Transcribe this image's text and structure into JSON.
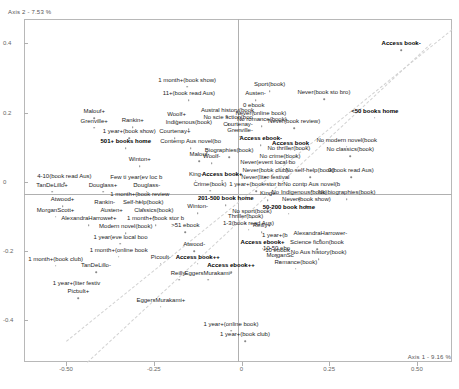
{
  "chart_data": {
    "type": "scatter",
    "title": "",
    "xlabel": "Axis 1 - 9.16 %",
    "ylabel": "Axis 2 - 7.53 %",
    "xlim": [
      -0.62,
      0.6
    ],
    "ylim": [
      -0.52,
      0.47
    ],
    "grid": false,
    "legend": "none",
    "xticks": [
      "-0.50",
      "-0.25",
      "0",
      "0.25",
      "0.50"
    ],
    "xtick_values": [
      -0.5,
      -0.25,
      0,
      0.25,
      0.5
    ],
    "yticks": [
      "0.4",
      "0.2",
      "0",
      "-0.2",
      "-0.4"
    ],
    "ytick_values": [
      0.4,
      0.2,
      0,
      -0.2,
      -0.4
    ],
    "points": [
      {
        "label": "1 month+(book show)",
        "x": -0.155,
        "y": 0.295,
        "bold": false
      },
      {
        "label": "11+(book read Aus)",
        "x": -0.15,
        "y": 0.255,
        "bold": false
      },
      {
        "label": "Malouf+",
        "x": -0.42,
        "y": 0.204,
        "bold": false
      },
      {
        "label": "Grenville+",
        "x": -0.42,
        "y": 0.176,
        "bold": false
      },
      {
        "label": "Rankin+",
        "x": -0.31,
        "y": 0.178,
        "bold": false
      },
      {
        "label": "Woolf+",
        "x": -0.185,
        "y": 0.197,
        "bold": false
      },
      {
        "label": "Indigenous(book)",
        "x": -0.15,
        "y": 0.172,
        "bold": false
      },
      {
        "label": "Austral history(book",
        "x": -0.04,
        "y": 0.207,
        "bold": false
      },
      {
        "label": "No scie fiction(boo",
        "x": -0.038,
        "y": 0.187,
        "bold": false
      },
      {
        "label": "Courtenay-",
        "x": -0.01,
        "y": 0.168,
        "bold": false
      },
      {
        "label": "Grenville-",
        "x": -0.004,
        "y": 0.15,
        "bold": false
      },
      {
        "label": "1 year+(book show)",
        "x": -0.32,
        "y": 0.146,
        "bold": false
      },
      {
        "label": "Courtenay+",
        "x": -0.19,
        "y": 0.146,
        "bold": false
      },
      {
        "label": "501+ books home",
        "x": -0.33,
        "y": 0.118,
        "bold": true
      },
      {
        "label": "Contemp Aus novel(bo",
        "x": -0.145,
        "y": 0.117,
        "bold": false
      },
      {
        "label": "Biographies(book)",
        "x": -0.035,
        "y": 0.092,
        "bold": false
      },
      {
        "label": "Malouf-",
        "x": -0.12,
        "y": 0.08,
        "bold": false
      },
      {
        "label": "Woolf-",
        "x": -0.085,
        "y": 0.074,
        "bold": false
      },
      {
        "label": "Winton+",
        "x": -0.29,
        "y": 0.066,
        "bold": false
      },
      {
        "label": "4-10(book read Aus)",
        "x": -0.505,
        "y": 0.016,
        "bold": false
      },
      {
        "label": "Few ti year(ev loc b",
        "x": -0.3,
        "y": 0.015,
        "bold": false
      },
      {
        "label": "King-",
        "x": -0.13,
        "y": 0.023,
        "bold": false
      },
      {
        "label": "Access book+",
        "x": -0.055,
        "y": 0.023,
        "bold": true
      },
      {
        "label": "TanDeLillo+",
        "x": -0.54,
        "y": -0.008,
        "bold": false
      },
      {
        "label": "Douglass+",
        "x": -0.395,
        "y": -0.008,
        "bold": false
      },
      {
        "label": "Douglass-",
        "x": -0.27,
        "y": -0.008,
        "bold": false
      },
      {
        "label": "Crime(book)",
        "x": -0.09,
        "y": -0.005,
        "bold": false
      },
      {
        "label": "1 month+(book review",
        "x": -0.29,
        "y": -0.035,
        "bold": false
      },
      {
        "label": "201-500 book home",
        "x": -0.045,
        "y": -0.047,
        "bold": true
      },
      {
        "label": "Atwood+",
        "x": -0.51,
        "y": -0.05,
        "bold": false
      },
      {
        "label": "Rankin-",
        "x": -0.39,
        "y": -0.057,
        "bold": false
      },
      {
        "label": "Self-help(book)",
        "x": -0.28,
        "y": -0.057,
        "bold": false
      },
      {
        "label": "Winton-",
        "x": -0.125,
        "y": -0.07,
        "bold": false
      },
      {
        "label": "MorganScott+",
        "x": -0.53,
        "y": -0.08,
        "bold": false
      },
      {
        "label": "Austen+",
        "x": -0.37,
        "y": -0.082,
        "bold": false
      },
      {
        "label": "Classics(book)",
        "x": -0.25,
        "y": -0.082,
        "bold": false
      },
      {
        "label": "No sport(book)",
        "x": 0.03,
        "y": -0.083,
        "bold": false
      },
      {
        "label": "Thriller(book)",
        "x": 0.012,
        "y": -0.1,
        "bold": false
      },
      {
        "label": "AlexandraHarrower+",
        "x": -0.435,
        "y": -0.105,
        "bold": false
      },
      {
        "label": "1 month+(book stor b",
        "x": -0.245,
        "y": -0.105,
        "bold": false
      },
      {
        "label": "1-3(book read Aus)",
        "x": 0.02,
        "y": -0.118,
        "bold": false
      },
      {
        "label": ">51 ebook",
        "x": -0.16,
        "y": -0.125,
        "bold": false
      },
      {
        "label": "Reilly+",
        "x": 0.058,
        "y": -0.125,
        "bold": false
      },
      {
        "label": "Modern novel(book)",
        "x": -0.33,
        "y": -0.128,
        "bold": false
      },
      {
        "label": "1 year(eve local boo",
        "x": -0.345,
        "y": -0.158,
        "bold": false
      },
      {
        "label": "1 year+(b",
        "x": 0.095,
        "y": -0.152,
        "bold": false
      },
      {
        "label": "Access ebook+",
        "x": 0.06,
        "y": -0.173,
        "bold": true
      },
      {
        "label": "Atwood-",
        "x": -0.135,
        "y": -0.18,
        "bold": false
      },
      {
        "label": "10-50 ebo",
        "x": 0.1,
        "y": -0.192,
        "bold": false
      },
      {
        "label": "1 month+(online book",
        "x": -0.35,
        "y": -0.196,
        "bold": false
      },
      {
        "label": "MorganSc",
        "x": 0.11,
        "y": -0.212,
        "bold": false
      },
      {
        "label": "Picoult-",
        "x": -0.23,
        "y": -0.216,
        "bold": false
      },
      {
        "label": "Access book++",
        "x": -0.125,
        "y": -0.216,
        "bold": true
      },
      {
        "label": "1 month+(book club)",
        "x": -0.53,
        "y": -0.222,
        "bold": false
      },
      {
        "label": "Access ebook++",
        "x": -0.03,
        "y": -0.24,
        "bold": true
      },
      {
        "label": "TanDeLillo-",
        "x": -0.415,
        "y": -0.24,
        "bold": false
      },
      {
        "label": "Reilly-",
        "x": -0.178,
        "y": -0.262,
        "bold": false
      },
      {
        "label": "EggersMurakami-",
        "x": -0.095,
        "y": -0.262,
        "bold": false
      },
      {
        "label": "Romance(book)",
        "x": 0.155,
        "y": -0.23,
        "bold": false
      },
      {
        "label": "1 year+(liter festiv",
        "x": -0.47,
        "y": -0.293,
        "bold": false
      },
      {
        "label": "Picoult+",
        "x": -0.465,
        "y": -0.315,
        "bold": false
      },
      {
        "label": "EggersMurakami+",
        "x": -0.23,
        "y": -0.34,
        "bold": false
      },
      {
        "label": "1 year+(online book)",
        "x": -0.03,
        "y": -0.41,
        "bold": false
      },
      {
        "label": "1 year+(book club)",
        "x": 0.01,
        "y": -0.44,
        "bold": false
      },
      {
        "label": "Access book-",
        "x": 0.455,
        "y": 0.4,
        "bold": true
      },
      {
        "label": "Sport(book)",
        "x": 0.08,
        "y": 0.282,
        "bold": false
      },
      {
        "label": "Austen-",
        "x": 0.04,
        "y": 0.256,
        "bold": false
      },
      {
        "label": "Never(book sto bro)",
        "x": 0.235,
        "y": 0.258,
        "bold": false
      },
      {
        "label": "0 ebook",
        "x": 0.035,
        "y": 0.222,
        "bold": false
      },
      {
        "label": "Never(online book)",
        "x": 0.055,
        "y": 0.2,
        "bold": false
      },
      {
        "label": "<50 books home",
        "x": 0.38,
        "y": 0.205,
        "bold": true
      },
      {
        "label": "No romance(book)",
        "x": 0.058,
        "y": 0.18,
        "bold": false
      },
      {
        "label": "Never(book review)",
        "x": 0.15,
        "y": 0.175,
        "bold": false
      },
      {
        "label": "Access ebook-",
        "x": 0.055,
        "y": 0.126,
        "bold": true
      },
      {
        "label": "No modern novel(book",
        "x": 0.3,
        "y": 0.122,
        "bold": false
      },
      {
        "label": "Access book",
        "x": 0.14,
        "y": 0.113,
        "bold": true
      },
      {
        "label": "No thriller(book)",
        "x": 0.135,
        "y": 0.098,
        "bold": false
      },
      {
        "label": "No classics(book)",
        "x": 0.31,
        "y": 0.094,
        "bold": false
      },
      {
        "label": "No crime(book)",
        "x": 0.11,
        "y": 0.075,
        "bold": false
      },
      {
        "label": "Never(event local bo",
        "x": 0.075,
        "y": 0.056,
        "bold": false
      },
      {
        "label": "Never(book club)",
        "x": 0.068,
        "y": 0.034,
        "bold": false
      },
      {
        "label": "No self-help(book)",
        "x": 0.195,
        "y": 0.034,
        "bold": false
      },
      {
        "label": "0(book read Aus)",
        "x": 0.312,
        "y": 0.034,
        "bold": false
      },
      {
        "label": "Never(liter festival",
        "x": 0.068,
        "y": 0.013,
        "bold": false
      },
      {
        "label": "1 year+(book stor br",
        "x": 0.042,
        "y": -0.006,
        "bold": false
      },
      {
        "label": "No contp Aus novel(b",
        "x": 0.2,
        "y": -0.006,
        "bold": false
      },
      {
        "label": "King+",
        "x": 0.075,
        "y": -0.032,
        "bold": false
      },
      {
        "label": "No Indigenous(book)",
        "x": 0.165,
        "y": -0.03,
        "bold": false
      },
      {
        "label": "No biographies(book)",
        "x": 0.3,
        "y": -0.03,
        "bold": false
      },
      {
        "label": "Never(book show)",
        "x": 0.185,
        "y": -0.05,
        "bold": false
      },
      {
        "label": "50-200 book home",
        "x": 0.135,
        "y": -0.072,
        "bold": true
      },
      {
        "label": "AlexandraHarrower-",
        "x": 0.225,
        "y": -0.148,
        "bold": false
      },
      {
        "label": "Science fiction(book",
        "x": 0.215,
        "y": -0.175,
        "bold": false
      },
      {
        "label": "-10 ebook",
        "x": 0.1,
        "y": -0.198,
        "bold": false
      },
      {
        "label": "No Aus history(book)",
        "x": 0.22,
        "y": -0.203,
        "bold": false
      }
    ]
  }
}
